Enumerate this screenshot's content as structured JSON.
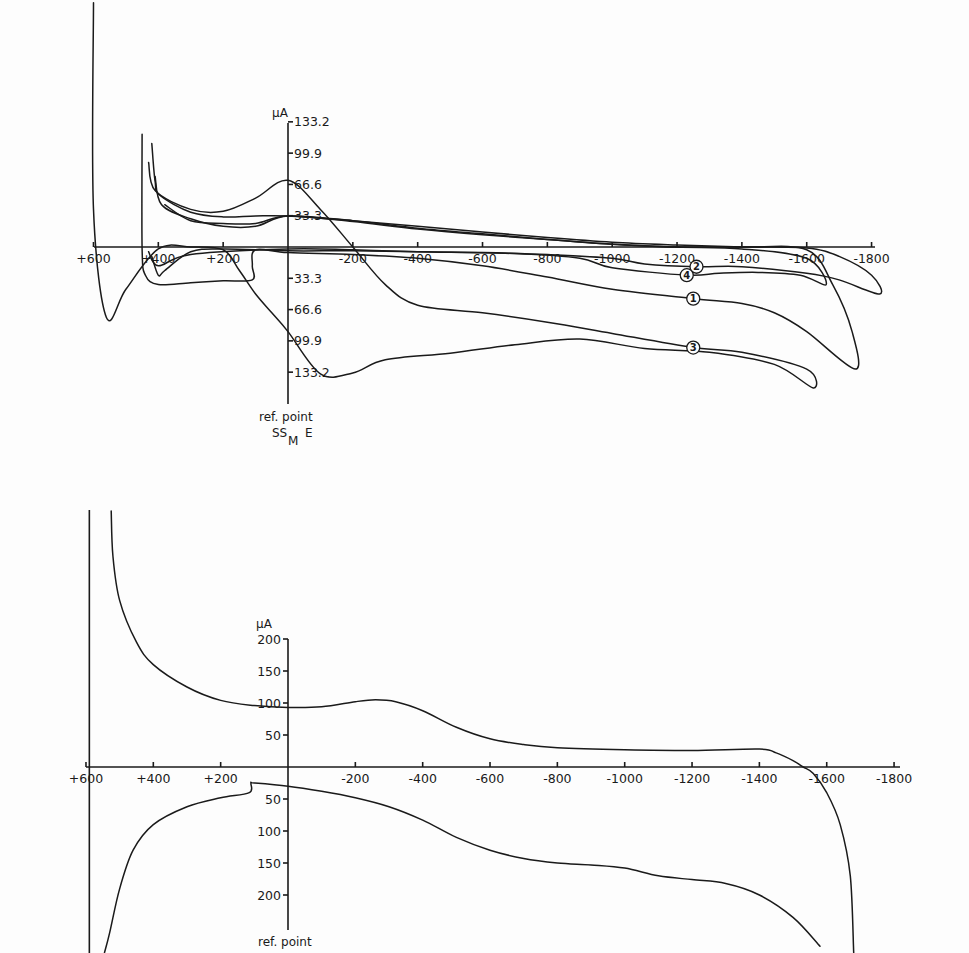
{
  "chart_data": [
    {
      "type": "line",
      "title": "",
      "subtitle": "Cyclic voltammograms, curves 1-4",
      "xlabel": "",
      "ylabel": "µA",
      "reference_label": "ref. point",
      "reference_electrode": {
        "main": "SS",
        "sub": "M",
        "suffix": "E"
      },
      "x_ticks": [
        "+600",
        "+400",
        "+200",
        "-200",
        "-400",
        "-600",
        "-800",
        "-1000",
        "-1200",
        "-1400",
        "-1600",
        "-1800"
      ],
      "x_tick_values": [
        600,
        400,
        200,
        -200,
        -400,
        -600,
        -800,
        -1000,
        -1200,
        -1400,
        -1600,
        -1800
      ],
      "y_ticks_positive": [
        "133.2",
        "99.9",
        "66.6",
        "33.3"
      ],
      "y_ticks_negative": [
        "33.3",
        "66.6",
        "99.9",
        "133.2"
      ],
      "y_tick_values": [
        133.2,
        99.9,
        66.6,
        33.3,
        -33.3,
        -66.6,
        -99.9,
        -133.2
      ],
      "xlim": [
        600,
        -1800
      ],
      "ylim": [
        -140,
        140
      ],
      "grid": false,
      "legend": "circled numbers on curves",
      "series": [
        {
          "name": "1",
          "label_at": [
            -1250,
            -55
          ],
          "points": [
            [
              420,
              110
            ],
            [
              410,
              70
            ],
            [
              395,
              55
            ],
            [
              300,
              37
            ],
            [
              200,
              32
            ],
            [
              100,
              33
            ],
            [
              0,
              33
            ],
            [
              -200,
              28
            ],
            [
              -400,
              22
            ],
            [
              -600,
              16
            ],
            [
              -800,
              10
            ],
            [
              -1000,
              5
            ],
            [
              -1200,
              2
            ],
            [
              -1400,
              0
            ],
            [
              -1600,
              -3
            ],
            [
              -1680,
              -40
            ],
            [
              -1740,
              -90
            ],
            [
              -1750,
              -130
            ],
            [
              -1600,
              -90
            ],
            [
              -1500,
              -70
            ],
            [
              -1400,
              -60
            ],
            [
              -1250,
              -55
            ],
            [
              -1000,
              -45
            ],
            [
              -800,
              -32
            ],
            [
              -600,
              -20
            ],
            [
              -400,
              -12
            ],
            [
              -200,
              -8
            ],
            [
              0,
              -6
            ],
            [
              100,
              -3
            ],
            [
              110,
              -20
            ],
            [
              110,
              -35
            ],
            [
              200,
              -36
            ],
            [
              300,
              -38
            ],
            [
              400,
              -40
            ],
            [
              440,
              -30
            ],
            [
              450,
              -2
            ],
            [
              450,
              120
            ]
          ]
        },
        {
          "name": "2",
          "label_at": [
            -1260,
            -21
          ],
          "points": [
            [
              410,
              75
            ],
            [
              390,
              45
            ],
            [
              300,
              30
            ],
            [
              200,
              22
            ],
            [
              100,
              22
            ],
            [
              0,
              33
            ],
            [
              -200,
              28
            ],
            [
              -400,
              20
            ],
            [
              -600,
              14
            ],
            [
              -800,
              8
            ],
            [
              -1000,
              3
            ],
            [
              -1200,
              0
            ],
            [
              -1400,
              0
            ],
            [
              -1600,
              -1
            ],
            [
              -1700,
              -10
            ],
            [
              -1800,
              -30
            ],
            [
              -1825,
              -50
            ],
            [
              -1700,
              -35
            ],
            [
              -1600,
              -28
            ],
            [
              -1400,
              -21
            ],
            [
              -1260,
              -21
            ],
            [
              -1100,
              -18
            ],
            [
              -1000,
              -12
            ],
            [
              -800,
              -8
            ],
            [
              -600,
              -6
            ],
            [
              -400,
              -5
            ],
            [
              -200,
              -4
            ],
            [
              0,
              -4
            ],
            [
              200,
              -2
            ],
            [
              300,
              -5
            ],
            [
              380,
              -25
            ],
            [
              400,
              -30
            ],
            [
              420,
              -10
            ]
          ]
        },
        {
          "name": "3",
          "label_at": [
            -1250,
            -107
          ],
          "points": [
            [
              430,
              90
            ],
            [
              410,
              60
            ],
            [
              300,
              40
            ],
            [
              200,
              38
            ],
            [
              100,
              52
            ],
            [
              0,
              71
            ],
            [
              -100,
              40
            ],
            [
              -200,
              0
            ],
            [
              -300,
              -40
            ],
            [
              -400,
              -62
            ],
            [
              -600,
              -70
            ],
            [
              -800,
              -80
            ],
            [
              -1000,
              -92
            ],
            [
              -1250,
              -107
            ],
            [
              -1400,
              -112
            ],
            [
              -1600,
              -130
            ],
            [
              -1620,
              -150
            ],
            [
              -1500,
              -125
            ],
            [
              -1300,
              -112
            ],
            [
              -1100,
              -108
            ],
            [
              -900,
              -98
            ],
            [
              -700,
              -104
            ],
            [
              -500,
              -113
            ],
            [
              -300,
              -120
            ],
            [
              -200,
              -134
            ],
            [
              -100,
              -135
            ],
            [
              0,
              -90
            ],
            [
              50,
              -70
            ],
            [
              100,
              -50
            ],
            [
              150,
              -25
            ],
            [
              200,
              -3
            ],
            [
              300,
              0
            ],
            [
              400,
              -2
            ],
            [
              500,
              -45
            ],
            [
              560,
              -75
            ],
            [
              600,
              40
            ],
            [
              600,
              260
            ]
          ]
        },
        {
          "name": "4",
          "label_at": [
            -1230,
            -30
          ],
          "points": [
            [
              380,
              45
            ],
            [
              300,
              28
            ],
            [
              200,
              25
            ],
            [
              100,
              25
            ],
            [
              0,
              33
            ],
            [
              -200,
              27
            ],
            [
              -400,
              19
            ],
            [
              -600,
              13
            ],
            [
              -800,
              8
            ],
            [
              -1000,
              3
            ],
            [
              -1200,
              0
            ],
            [
              -1400,
              -2
            ],
            [
              -1600,
              -12
            ],
            [
              -1660,
              -40
            ],
            [
              -1580,
              -30
            ],
            [
              -1450,
              -27
            ],
            [
              -1330,
              -28
            ],
            [
              -1230,
              -30
            ],
            [
              -1000,
              -22
            ],
            [
              -900,
              -12
            ],
            [
              -700,
              -7
            ],
            [
              -400,
              -5
            ],
            [
              -200,
              -3
            ],
            [
              0,
              -2
            ],
            [
              300,
              -8
            ],
            [
              400,
              -20
            ],
            [
              430,
              -5
            ]
          ]
        }
      ]
    },
    {
      "type": "line",
      "title": "",
      "xlabel": "",
      "ylabel": "µA",
      "reference_label": "ref. point",
      "x_ticks": [
        "+600",
        "+400",
        "+200",
        "-200",
        "-400",
        "-600",
        "-800",
        "-1000",
        "-1200",
        "-1400",
        "-1600",
        "-1800"
      ],
      "x_tick_values": [
        600,
        400,
        200,
        -200,
        -400,
        -600,
        -800,
        -1000,
        -1200,
        -1400,
        -1600,
        -1800
      ],
      "y_ticks_positive": [
        "200",
        "150",
        "100",
        "50"
      ],
      "y_ticks_negative": [
        "50",
        "100",
        "150",
        "200"
      ],
      "y_tick_values": [
        200,
        150,
        100,
        50,
        -50,
        -100,
        -150,
        -200
      ],
      "xlim": [
        600,
        -1800
      ],
      "ylim": [
        -280,
        400
      ],
      "grid": false,
      "series": [
        {
          "name": "cathodic sweep (upper branch)",
          "points": [
            [
              525,
              400
            ],
            [
              520,
              330
            ],
            [
              500,
              260
            ],
            [
              450,
              195
            ],
            [
              400,
              160
            ],
            [
              300,
              125
            ],
            [
              200,
              104
            ],
            [
              100,
              96
            ],
            [
              0,
              93
            ],
            [
              -100,
              94
            ],
            [
              -200,
              102
            ],
            [
              -260,
              105
            ],
            [
              -320,
              102
            ],
            [
              -400,
              88
            ],
            [
              -500,
              62
            ],
            [
              -600,
              44
            ],
            [
              -700,
              35
            ],
            [
              -800,
              30
            ],
            [
              -1000,
              27
            ],
            [
              -1200,
              26
            ],
            [
              -1400,
              28
            ],
            [
              -1450,
              22
            ],
            [
              -1500,
              10
            ],
            [
              -1530,
              0
            ],
            [
              -1560,
              -10
            ],
            [
              -1600,
              -40
            ],
            [
              -1640,
              -90
            ],
            [
              -1670,
              -170
            ],
            [
              -1680,
              -290
            ]
          ]
        },
        {
          "name": "anodic sweep (lower branch)",
          "points": [
            [
              -1580,
              -280
            ],
            [
              -1500,
              -235
            ],
            [
              -1400,
              -200
            ],
            [
              -1300,
              -182
            ],
            [
              -1200,
              -176
            ],
            [
              -1100,
              -170
            ],
            [
              -1000,
              -158
            ],
            [
              -900,
              -153
            ],
            [
              -800,
              -150
            ],
            [
              -700,
              -143
            ],
            [
              -600,
              -130
            ],
            [
              -500,
              -110
            ],
            [
              -400,
              -83
            ],
            [
              -300,
              -62
            ],
            [
              -200,
              -48
            ],
            [
              -100,
              -38
            ],
            [
              0,
              -30
            ],
            [
              100,
              -25
            ],
            [
              110,
              -25
            ],
            [
              115,
              -40
            ],
            [
              200,
              -48
            ],
            [
              300,
              -62
            ],
            [
              400,
              -90
            ],
            [
              460,
              -130
            ],
            [
              500,
              -190
            ],
            [
              530,
              -260
            ],
            [
              545,
              -290
            ]
          ]
        }
      ],
      "extra_vertical_line_at": 590
    }
  ],
  "labels": {
    "top_unit": "µA",
    "bottom_unit": "µA",
    "ref_point": "ref. point",
    "ref_electrode_main": "SS",
    "ref_electrode_sub": "M",
    "ref_electrode_suffix": "E"
  }
}
